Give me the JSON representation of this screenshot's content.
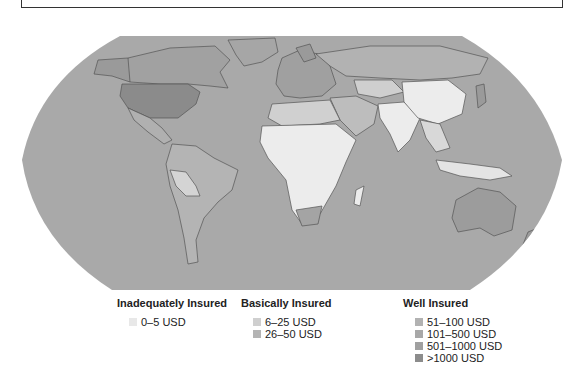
{
  "map": {
    "title": "",
    "colors": {
      "ocean": "#a9a9a9",
      "inadequate": "#ececec",
      "basic_low": "#cfcfcf",
      "basic_high": "#bdbdbd",
      "well_51_100": "#b0b0b0",
      "well_101_500": "#a5a5a5",
      "well_501_1000": "#9a9a9a",
      "well_1000_plus": "#8e8e8e",
      "border": "#555555"
    }
  },
  "legend": {
    "groups": [
      {
        "title": "Inadequately Insured",
        "items": [
          {
            "label": "0–5 USD",
            "color": "#e8e8e8"
          }
        ]
      },
      {
        "title": "Basically Insured",
        "items": [
          {
            "label": "6–25 USD",
            "color": "#cfcfcf"
          },
          {
            "label": "26–50 USD",
            "color": "#b4b4b4"
          }
        ]
      },
      {
        "title": "Well Insured",
        "items": [
          {
            "label": "51–100 USD",
            "color": "#b2b2b2"
          },
          {
            "label": "101–500 USD",
            "color": "#a8a8a8"
          },
          {
            "label": "501–1000 USD",
            "color": "#a0a0a0"
          },
          {
            "label": ">1000 USD",
            "color": "#8c8c8c"
          }
        ]
      }
    ]
  }
}
